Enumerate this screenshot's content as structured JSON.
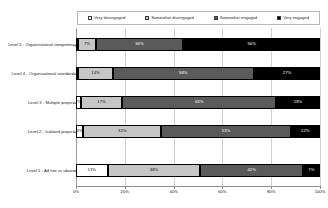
{
  "chart_data": {
    "type": "bar",
    "orientation": "horizontal",
    "stacked": true,
    "stack_mode": "percent",
    "title": "",
    "xlabel": "",
    "ylabel": "",
    "xlim": [
      0,
      100
    ],
    "xticks": [
      "0%",
      "20%",
      "40%",
      "60%",
      "80%",
      "100%"
    ],
    "xtick_values": [
      0,
      20,
      40,
      60,
      80,
      100
    ],
    "grid": true,
    "grid_axis": "x",
    "legend_position": "top",
    "categories": [
      "Level 5 - Organisational competency",
      "Level 4 - Organisational standards",
      "Level 3 - Multiple projects",
      "Level 2 - Isolated projects",
      "Level 1 - Ad hoc or absent"
    ],
    "series": [
      {
        "name": "Very disengaged",
        "color": "#ffffff",
        "values": [
          1,
          1,
          2,
          3,
          13
        ],
        "labels": [
          "1%",
          "1%",
          "2%",
          "3%",
          "13%"
        ]
      },
      {
        "name": "Somewhat disengaged",
        "color": "#c6c6c6",
        "values": [
          7,
          14,
          17,
          32,
          38
        ],
        "labels": [
          "7%",
          "14%",
          "17%",
          "32%",
          "38%"
        ]
      },
      {
        "name": "Somewhat engaged",
        "color": "#5a5a5a",
        "values": [
          36,
          58,
          63,
          53,
          42
        ],
        "labels": [
          "36%",
          "58%",
          "63%",
          "53%",
          "42%"
        ]
      },
      {
        "name": "Very engaged",
        "color": "#000000",
        "values": [
          56,
          27,
          18,
          12,
          7
        ],
        "labels": [
          "56%",
          "27%",
          "18%",
          "12%",
          "7%"
        ]
      }
    ]
  }
}
